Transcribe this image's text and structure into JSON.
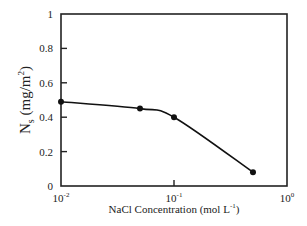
{
  "chart_data": {
    "type": "line",
    "title": "",
    "xlabel": "NaCl Concentration (mol L^-1)",
    "ylabel": "N_s (mg/m^2)",
    "xscale": "log",
    "xlim": [
      0.01,
      1
    ],
    "ylim": [
      0,
      1
    ],
    "x_ticks": [
      "10^-2",
      "10^-1",
      "10^0"
    ],
    "y_ticks": [
      "0",
      "0.2",
      "0.4",
      "0.6",
      "0.8",
      "1"
    ],
    "grid": false,
    "legend": null,
    "series": [
      {
        "name": "Ns",
        "x": [
          0.01,
          0.05,
          0.1,
          0.5
        ],
        "values": [
          0.49,
          0.45,
          0.4,
          0.08
        ],
        "marker": "circle",
        "smooth": true
      }
    ]
  },
  "labels": {
    "x_axis_main": "NaCl Concentration (mol L",
    "x_axis_sup": "-1",
    "x_axis_close": ")",
    "y_axis_main": "N",
    "y_axis_sub": "s",
    "y_axis_rest": " (mg/m",
    "y_axis_sup": "2",
    "y_axis_close": ")",
    "x_tick_base": "10",
    "x_tick_exps": [
      "-2",
      "-1",
      "0"
    ],
    "y_tick_labels": [
      "0",
      "0.2",
      "0.4",
      "0.6",
      "0.8",
      "1"
    ]
  }
}
